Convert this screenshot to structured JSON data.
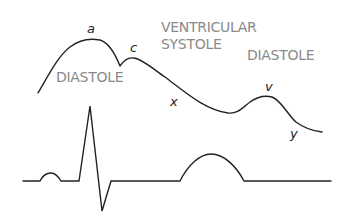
{
  "diagram": {
    "type": "jvp-ecg-correlation",
    "colors": {
      "trace": "#222222",
      "phase_label": "#8a8a8a",
      "wave_label": "#222222"
    },
    "phase_labels": {
      "diastole_left": "DIASTOLE",
      "ventricular_line1": "VENTRICULAR",
      "ventricular_line2": "SYSTOLE",
      "diastole_right": "DIASTOLE"
    },
    "jvp_wave_labels": {
      "a": "a",
      "c": "c",
      "x": "x",
      "v": "v",
      "y": "y"
    },
    "traces": {
      "jvp": "JVP waveform",
      "ecg": "ECG trace"
    }
  }
}
